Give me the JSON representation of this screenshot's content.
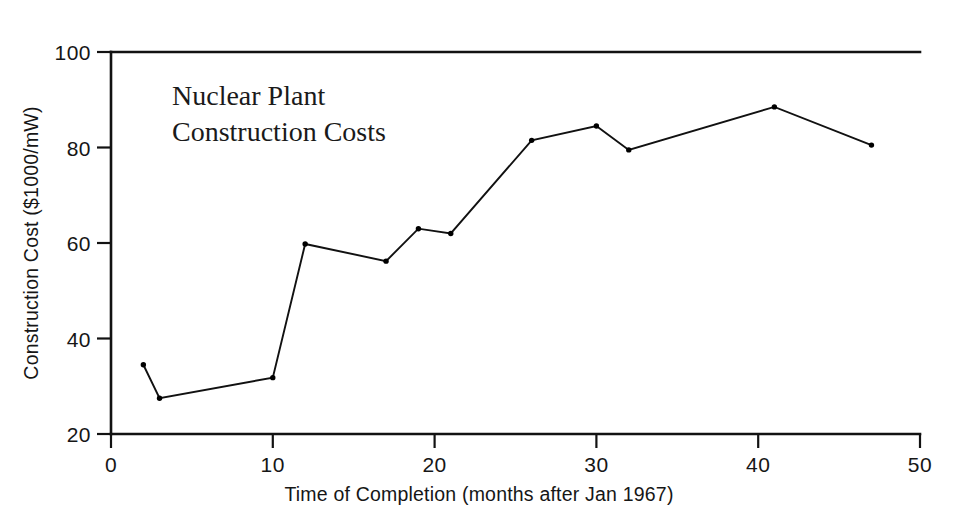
{
  "chart_data": {
    "type": "line",
    "title": "",
    "annotation_lines": [
      "Nuclear Plant",
      "Construction Costs"
    ],
    "xlabel": "Time of Completion (months after Jan 1967)",
    "ylabel": "Construction Cost ($1000/mW)",
    "xlim": [
      0,
      50
    ],
    "ylim": [
      20,
      100
    ],
    "xticks": [
      0,
      10,
      20,
      30,
      40,
      50
    ],
    "xtick_labels": [
      "0",
      "10",
      "20",
      "30",
      "40",
      "50"
    ],
    "yticks": [
      20,
      40,
      60,
      80,
      100
    ],
    "ytick_labels": [
      "20",
      "40",
      "60",
      "80",
      "100"
    ],
    "grid": false,
    "legend": null,
    "marker": "dot",
    "line_color": "#111111",
    "series": [
      {
        "name": "Construction Cost",
        "x": [
          2,
          3,
          10,
          12,
          17,
          19,
          21,
          26,
          30,
          32,
          41,
          47
        ],
        "y": [
          34.5,
          27.5,
          31.8,
          59.8,
          56.2,
          63.0,
          62.0,
          81.5,
          84.5,
          79.5,
          88.5,
          80.5
        ]
      }
    ]
  },
  "figure": {
    "background_color": "#ffffff",
    "axis_color": "#121212"
  }
}
